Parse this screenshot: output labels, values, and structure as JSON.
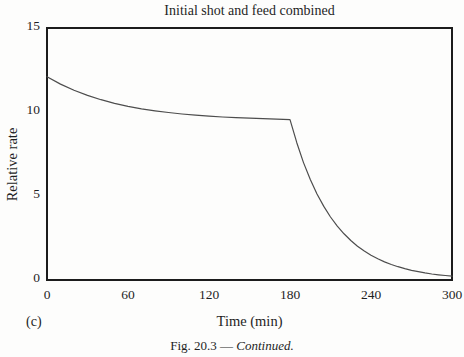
{
  "figure": {
    "panel_label": "(c)",
    "caption_prefix": "Fig. 20.3 — ",
    "caption_emphasis": "Continued."
  },
  "colors": {
    "axis": "#1c1c1c",
    "curve": "#4d4d4d",
    "text": "#1f1f1f",
    "background": "#fdfdfc"
  },
  "chart_data": {
    "type": "line",
    "title": "Initial shot and feed combined",
    "xlabel": "Time (min)",
    "ylabel": "Relative rate",
    "xlim": [
      0,
      300
    ],
    "ylim": [
      0,
      15
    ],
    "x_ticks": [
      0,
      60,
      120,
      180,
      240,
      300
    ],
    "y_ticks": [
      0,
      5,
      10,
      15
    ],
    "grid": false,
    "legend": "none",
    "frame": "full-box",
    "series": [
      {
        "name": "relative-rate",
        "points": [
          [
            0,
            12.1
          ],
          [
            10,
            11.66
          ],
          [
            20,
            11.29
          ],
          [
            30,
            10.99
          ],
          [
            40,
            10.73
          ],
          [
            50,
            10.52
          ],
          [
            60,
            10.34
          ],
          [
            70,
            10.19
          ],
          [
            80,
            10.07
          ],
          [
            90,
            9.97
          ],
          [
            100,
            9.88
          ],
          [
            110,
            9.81
          ],
          [
            120,
            9.75
          ],
          [
            130,
            9.7
          ],
          [
            140,
            9.66
          ],
          [
            150,
            9.63
          ],
          [
            160,
            9.6
          ],
          [
            170,
            9.57
          ],
          [
            180,
            9.55
          ],
          [
            185,
            8.17
          ],
          [
            190,
            6.99
          ],
          [
            195,
            5.98
          ],
          [
            200,
            5.12
          ],
          [
            205,
            4.38
          ],
          [
            210,
            3.75
          ],
          [
            215,
            3.21
          ],
          [
            220,
            2.75
          ],
          [
            225,
            2.35
          ],
          [
            230,
            2.01
          ],
          [
            235,
            1.72
          ],
          [
            240,
            1.47
          ],
          [
            245,
            1.26
          ],
          [
            250,
            1.08
          ],
          [
            255,
            0.92
          ],
          [
            260,
            0.79
          ],
          [
            265,
            0.68
          ],
          [
            270,
            0.58
          ],
          [
            275,
            0.5
          ],
          [
            280,
            0.42
          ],
          [
            285,
            0.36
          ],
          [
            290,
            0.31
          ],
          [
            295,
            0.27
          ],
          [
            300,
            0.23
          ]
        ]
      }
    ]
  }
}
